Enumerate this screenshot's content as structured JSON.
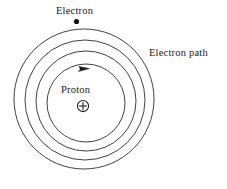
{
  "figure": {
    "type": "diagram",
    "width": 227,
    "height": 189,
    "background_color": "#ffffff",
    "stroke_color": "#2b2b2b",
    "stroke_width": 0.9
  },
  "labels": {
    "electron": "Electron",
    "electron_path": "Electron path",
    "proton": "Proton"
  },
  "nucleus": {
    "symbol": "+",
    "name": "proton",
    "center_x": 83,
    "center_y": 106,
    "radius": 5.6,
    "charge_sign": "+"
  },
  "electron": {
    "name": "electron",
    "center_x": 76.5,
    "center_y": 21.5,
    "radius": 2.6,
    "color": "#111111",
    "on_orbit_index": 0
  },
  "orbits": [
    {
      "name": "orbit-4-outer",
      "center_x": 84,
      "center_y": 99,
      "radius": 70
    },
    {
      "name": "orbit-3",
      "center_x": 85,
      "center_y": 100,
      "radius": 60
    },
    {
      "name": "orbit-2",
      "center_x": 86,
      "center_y": 101,
      "radius": 50
    },
    {
      "name": "orbit-1-inner",
      "center_x": 86,
      "center_y": 103,
      "radius": 39
    }
  ],
  "direction_arrow": {
    "name": "orbit-direction-arrow",
    "tip_x": 86,
    "tip_y": 69.5,
    "direction": "clockwise",
    "size": 6
  }
}
